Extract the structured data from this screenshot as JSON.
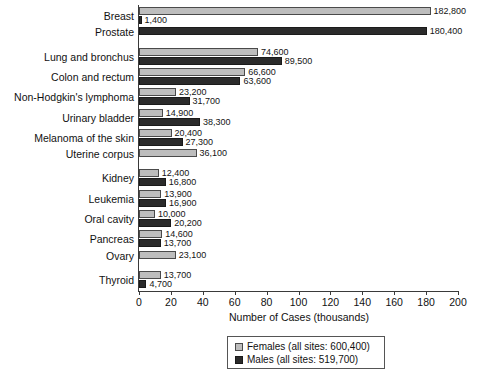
{
  "chart_data": {
    "type": "bar",
    "orientation": "horizontal",
    "title": "",
    "xlabel": "Number of Cases (thousands)",
    "ylabel": "",
    "xlim": [
      0,
      200
    ],
    "xticks": [
      0,
      20,
      40,
      60,
      80,
      100,
      120,
      140,
      160,
      180,
      200
    ],
    "grid": false,
    "legend_position": "bottom-center",
    "units": "cases",
    "categories": [
      "Breast",
      "Prostate",
      "Lung and bronchus",
      "Colon and rectum",
      "Non-Hodgkin's lymphoma",
      "Urinary bladder",
      "Melanoma of the skin",
      "Uterine corpus",
      "Kidney",
      "Leukemia",
      "Oral cavity",
      "Pancreas",
      "Ovary",
      "Thyroid"
    ],
    "series": [
      {
        "name": "Females (all sites: 600,400)",
        "short_name": "Females",
        "color": "#bdbdbd",
        "total": 600400,
        "values": [
          182800,
          null,
          74600,
          66600,
          23200,
          14900,
          20400,
          36100,
          12400,
          13900,
          10000,
          14600,
          23100,
          13700
        ],
        "labels": [
          "182,800",
          null,
          "74,600",
          "66,600",
          "23,200",
          "14,900",
          "20,400",
          "36,100",
          "12,400",
          "13,900",
          "10,000",
          "14,600",
          "23,100",
          "13,700"
        ]
      },
      {
        "name": "Males (all sites: 519,700)",
        "short_name": "Males",
        "color": "#2b2b2b",
        "total": 519700,
        "values": [
          1400,
          180400,
          89500,
          63600,
          31700,
          38300,
          27300,
          null,
          16800,
          16900,
          20200,
          13700,
          null,
          4700
        ],
        "labels": [
          "1,400",
          "180,400",
          "89,500",
          "63,600",
          "31,700",
          "38,300",
          "27,300",
          null,
          "16,800",
          "16,900",
          "20,200",
          "13,700",
          null,
          "4,700"
        ]
      }
    ]
  },
  "axis": {
    "x_title": "Number of Cases (thousands)",
    "tick_labels": [
      "0",
      "20",
      "40",
      "60",
      "80",
      "100",
      "120",
      "140",
      "160",
      "180",
      "200"
    ]
  },
  "legend": {
    "items": [
      {
        "label": "Females (all sites: 600,400)",
        "color": "#bdbdbd"
      },
      {
        "label": "Males (all sites: 519,700)",
        "color": "#2b2b2b"
      }
    ]
  },
  "colors": {
    "female": "#bdbdbd",
    "male": "#2b2b2b",
    "axis": "#3a3a3a",
    "text": "#111111",
    "background": "#ffffff"
  }
}
